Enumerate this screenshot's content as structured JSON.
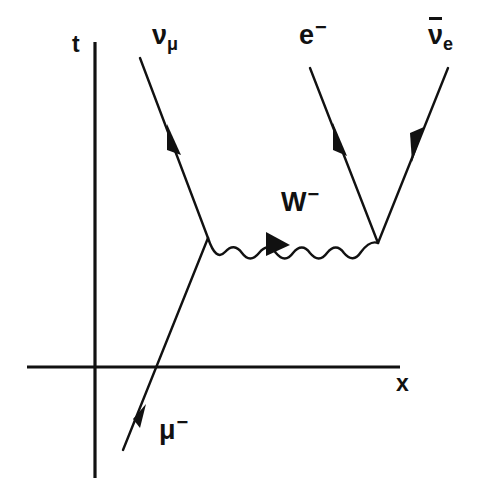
{
  "figure": {
    "kind": "feynman-diagram",
    "background_color": "#ffffff",
    "ink_color": "#111111"
  },
  "axes": {
    "vertical": {
      "name": "time-axis",
      "label": "t",
      "x": 95,
      "y_top": 42,
      "y_bottom": 478
    },
    "horizontal": {
      "name": "space-axis",
      "label": "x",
      "y": 367,
      "x_left": 27,
      "x_right": 400
    },
    "origin": {
      "x": 95,
      "y": 367
    }
  },
  "vertices": [
    {
      "name": "left-vertex",
      "x": 208,
      "y": 238
    },
    {
      "name": "right-vertex",
      "x": 378,
      "y": 243
    }
  ],
  "particles": [
    {
      "id": "muon-in",
      "label": "μ",
      "superscript": "−",
      "label_full": "μ−",
      "line_type": "fermion",
      "from": {
        "x": 123,
        "y": 450
      },
      "to": {
        "x": 208,
        "y": 238
      },
      "arrow_at": {
        "x": 146,
        "y": 416
      },
      "arrow_direction": "up-right",
      "label_pos": {
        "x": 159,
        "y": 412
      }
    },
    {
      "id": "muon-neutrino-out",
      "label": "ν",
      "subscript": "μ",
      "label_full": "νμ",
      "line_type": "fermion",
      "from": {
        "x": 208,
        "y": 238
      },
      "to": {
        "x": 140,
        "y": 58
      },
      "arrow_at": {
        "x": 176,
        "y": 152
      },
      "arrow_direction": "up-left",
      "label_pos": {
        "x": 152,
        "y": 22
      }
    },
    {
      "id": "electron-out",
      "label": "e",
      "superscript": "−",
      "label_full": "e−",
      "line_type": "fermion",
      "from": {
        "x": 378,
        "y": 243
      },
      "to": {
        "x": 310,
        "y": 68
      },
      "arrow_at": {
        "x": 341,
        "y": 148
      },
      "arrow_direction": "up-left",
      "label_pos": {
        "x": 299,
        "y": 17
      }
    },
    {
      "id": "electron-antineutrino-out",
      "label": "ν",
      "subscript": "e",
      "overline": true,
      "label_full": "ν̅e",
      "line_type": "fermion",
      "from": {
        "x": 448,
        "y": 68
      },
      "to": {
        "x": 378,
        "y": 243
      },
      "arrow_at": {
        "x": 417,
        "y": 145
      },
      "arrow_direction": "down-left",
      "label_pos": {
        "x": 428,
        "y": 22
      }
    },
    {
      "id": "w-boson-propagator",
      "label": "W",
      "superscript": "−",
      "label_full": "W−",
      "line_type": "boson-wavy",
      "from": {
        "x": 208,
        "y": 238
      },
      "to": {
        "x": 378,
        "y": 243
      },
      "wave_amplitude": 11,
      "wave_cycles": 5,
      "arrow_at": {
        "x": 278,
        "y": 241
      },
      "arrow_direction": "right",
      "label_pos": {
        "x": 281,
        "y": 184
      }
    }
  ],
  "labels": {
    "time_axis": "t",
    "space_axis": "x",
    "muon": "μ",
    "muon_charge": "−",
    "muon_neutrino": "ν",
    "muon_neutrino_sub": "μ",
    "electron": "e",
    "electron_charge": "−",
    "electron_antineutrino": "ν",
    "electron_antineutrino_sub": "e",
    "w_boson": "W",
    "w_boson_charge": "−"
  }
}
